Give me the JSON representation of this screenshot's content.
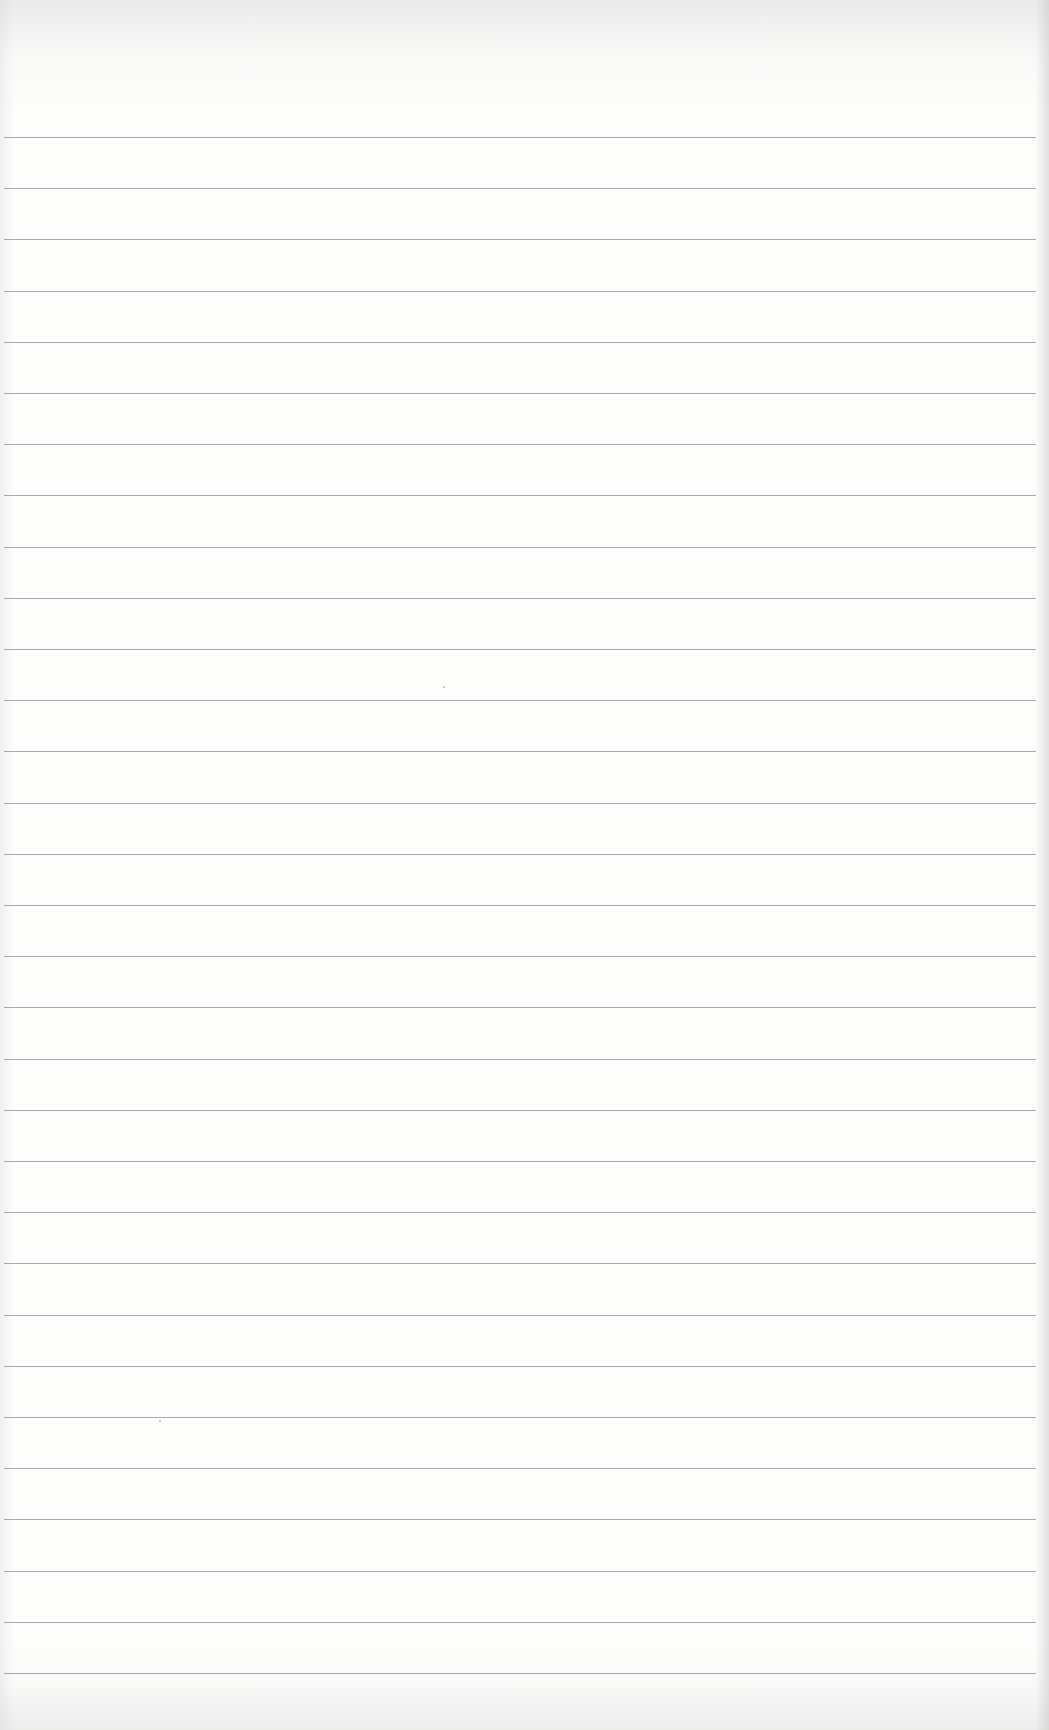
{
  "document": {
    "type": "ruled-paper",
    "page_title": "",
    "line_count": 31,
    "first_line_y": 137,
    "line_spacing_px": 51.2,
    "line_left_px": 4,
    "line_width_px": 1032,
    "colors": {
      "paper": "#fdfdfc",
      "rule_line": "#9a9a9a",
      "edge_shadow": "#c8c8c8"
    },
    "written_text": []
  }
}
